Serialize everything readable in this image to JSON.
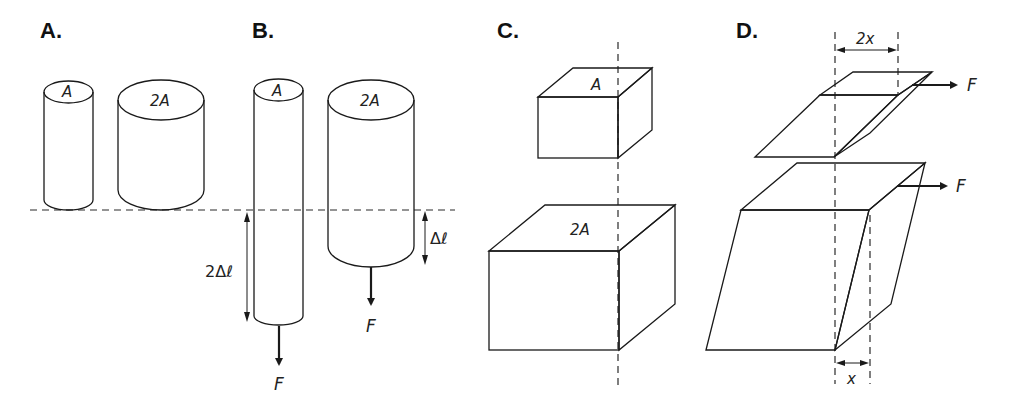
{
  "figure": {
    "panels": [
      {
        "id": "A",
        "label": "A.",
        "shapes": [
          {
            "type": "cylinder",
            "area_label": "A"
          },
          {
            "type": "cylinder",
            "area_label": "2A"
          }
        ]
      },
      {
        "id": "B",
        "label": "B.",
        "shapes": [
          {
            "type": "cylinder",
            "area_label": "A",
            "force_label": "F",
            "elongation_label": "2Δℓ"
          },
          {
            "type": "cylinder",
            "area_label": "2A",
            "force_label": "F",
            "elongation_label": "Δℓ"
          }
        ]
      },
      {
        "id": "C",
        "label": "C.",
        "shapes": [
          {
            "type": "box",
            "area_label": "A"
          },
          {
            "type": "box",
            "area_label": "2A"
          }
        ]
      },
      {
        "id": "D",
        "label": "D.",
        "shapes": [
          {
            "type": "sheared-slab",
            "force_label": "F",
            "displacement_label": "2x"
          },
          {
            "type": "sheared-block",
            "force_label": "F",
            "displacement_label": "x"
          }
        ]
      }
    ],
    "labels": {
      "panel_a": "A.",
      "panel_b": "B.",
      "panel_c": "C.",
      "panel_d": "D.",
      "area_a": "A",
      "area_2a": "2A",
      "force": "F",
      "elong_2": "2Δℓ",
      "elong_1": "Δℓ",
      "shear_2x": "2x",
      "shear_x": "x"
    },
    "colors": {
      "line": "#1a1a1a",
      "background": "#ffffff"
    }
  }
}
